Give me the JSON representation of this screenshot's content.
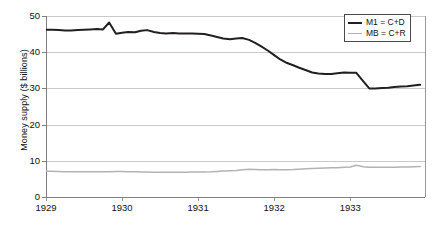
{
  "chart_data": {
    "type": "line",
    "title": "",
    "xlabel": "",
    "ylabel": "Money supply ($ billions)",
    "xlim": [
      1929.0,
      1933.97
    ],
    "ylim": [
      0,
      50
    ],
    "yticks": [
      0,
      10,
      20,
      30,
      40,
      50
    ],
    "xticks": [
      1929,
      1930,
      1931,
      1932,
      1933
    ],
    "xtick_labels": [
      "1929",
      "1930",
      "1931",
      "1932",
      "1933"
    ],
    "ytick_labels": [
      "0",
      "10",
      "20",
      "30",
      "40",
      "50"
    ],
    "grid": "horizontal",
    "legend_position": "top-right",
    "series": [
      {
        "name": "M1 = C+D",
        "color": "#231f20",
        "width": 2,
        "x": [
          1929.0,
          1929.08,
          1929.17,
          1929.25,
          1929.33,
          1929.42,
          1929.5,
          1929.58,
          1929.67,
          1929.75,
          1929.83,
          1929.92,
          1930.0,
          1930.08,
          1930.17,
          1930.25,
          1930.33,
          1930.42,
          1930.5,
          1930.58,
          1930.67,
          1930.75,
          1930.83,
          1930.92,
          1931.0,
          1931.08,
          1931.17,
          1931.25,
          1931.33,
          1931.42,
          1931.5,
          1931.58,
          1931.67,
          1931.75,
          1931.83,
          1931.92,
          1932.0,
          1932.08,
          1932.17,
          1932.25,
          1932.33,
          1932.42,
          1932.5,
          1932.58,
          1932.67,
          1932.75,
          1932.83,
          1932.92,
          1933.0,
          1933.08,
          1933.17,
          1933.25,
          1933.33,
          1933.42,
          1933.5,
          1933.58,
          1933.67,
          1933.75,
          1933.83,
          1933.92
        ],
        "y": [
          46.2,
          46.2,
          46.1,
          46.0,
          46.0,
          46.1,
          46.2,
          46.3,
          46.4,
          46.3,
          48.2,
          45.1,
          45.4,
          45.6,
          45.5,
          45.9,
          46.1,
          45.6,
          45.3,
          45.2,
          45.3,
          45.2,
          45.2,
          45.2,
          45.1,
          45.0,
          44.6,
          44.2,
          43.8,
          43.6,
          43.8,
          43.9,
          43.4,
          42.6,
          41.6,
          40.4,
          39.2,
          38.0,
          37.0,
          36.4,
          35.7,
          35.0,
          34.4,
          34.1,
          34.0,
          34.0,
          34.2,
          34.4,
          34.3,
          34.3,
          32.0,
          30.0,
          30.0,
          30.1,
          30.2,
          30.4,
          30.5,
          30.6,
          30.8,
          31.0
        ]
      },
      {
        "name": "MB = C+R",
        "color": "#b3b3b3",
        "width": 1.5,
        "x": [
          1929.0,
          1929.08,
          1929.17,
          1929.25,
          1929.33,
          1929.42,
          1929.5,
          1929.58,
          1929.67,
          1929.75,
          1929.83,
          1929.92,
          1930.0,
          1930.08,
          1930.17,
          1930.25,
          1930.33,
          1930.42,
          1930.5,
          1930.58,
          1930.67,
          1930.75,
          1930.83,
          1930.92,
          1931.0,
          1931.08,
          1931.17,
          1931.25,
          1931.33,
          1931.42,
          1931.5,
          1931.58,
          1931.67,
          1931.75,
          1931.83,
          1931.92,
          1932.0,
          1932.08,
          1932.17,
          1932.25,
          1932.33,
          1932.42,
          1932.5,
          1932.58,
          1932.67,
          1932.75,
          1932.83,
          1932.92,
          1933.0,
          1933.08,
          1933.17,
          1933.25,
          1933.33,
          1933.42,
          1933.5,
          1933.58,
          1933.67,
          1933.75,
          1933.83,
          1933.92
        ],
        "y": [
          7.1,
          7.1,
          7.05,
          7.0,
          7.0,
          6.95,
          6.95,
          6.95,
          6.95,
          6.95,
          7.0,
          7.05,
          7.05,
          7.0,
          6.95,
          6.9,
          6.9,
          6.85,
          6.85,
          6.85,
          6.85,
          6.85,
          6.85,
          6.9,
          6.9,
          6.9,
          6.95,
          7.05,
          7.15,
          7.25,
          7.35,
          7.5,
          7.65,
          7.6,
          7.55,
          7.55,
          7.6,
          7.55,
          7.55,
          7.6,
          7.7,
          7.8,
          7.9,
          7.95,
          8.0,
          8.05,
          8.1,
          8.2,
          8.3,
          8.75,
          8.35,
          8.2,
          8.2,
          8.2,
          8.25,
          8.25,
          8.3,
          8.3,
          8.35,
          8.4
        ]
      }
    ]
  },
  "legend": {
    "items": [
      {
        "label": "M1 = C+D"
      },
      {
        "label": "MB = C+R"
      }
    ]
  },
  "axes": {
    "y_title": "Money supply ($ billions)"
  }
}
